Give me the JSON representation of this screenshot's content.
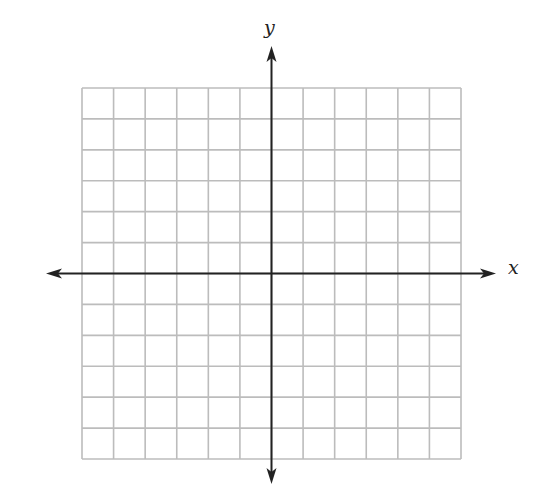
{
  "diagram": {
    "type": "coordinate-plane",
    "x_axis_label": "x",
    "y_axis_label": "y",
    "grid": {
      "columns": 12,
      "rows": 12,
      "left": 82,
      "top": 88,
      "right": 461,
      "bottom": 459,
      "origin_column": 6,
      "origin_row": 6,
      "line_color": "#bcbcbc"
    },
    "axes": {
      "color": "#222222",
      "x_arrow_left": 46,
      "x_arrow_right": 496,
      "y_arrow_top": 46,
      "y_arrow_bottom": 484
    }
  }
}
